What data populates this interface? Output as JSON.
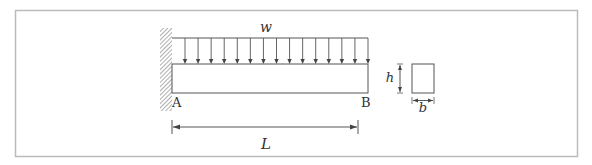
{
  "diagram": {
    "type": "cantilever-beam-uniform-load",
    "load_label": "w",
    "support_left_label": "A",
    "free_end_label": "B",
    "length_label": "L",
    "section": {
      "height_label": "h",
      "width_label": "b",
      "shape": "rectangle"
    },
    "load_arrow_count": 15,
    "colors": {
      "line": "#555555",
      "frame": "#bbbbbb",
      "hatch": "#777777"
    }
  }
}
